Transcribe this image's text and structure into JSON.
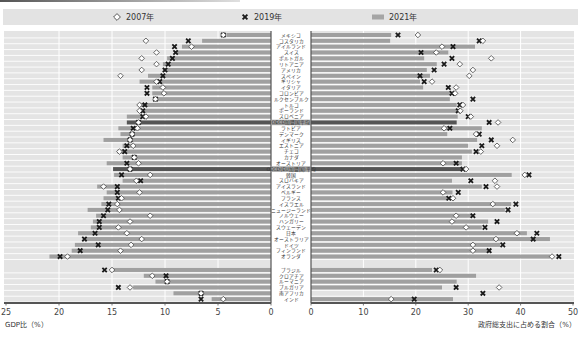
{
  "chart_data": {
    "type": "bar",
    "subtype": "back-to-back horizontal bar with point markers",
    "title": "",
    "legend_position": "top",
    "grid": true,
    "legend": [
      {
        "label": "2007年",
        "marker": "diamond"
      },
      {
        "label": "2019年",
        "marker": "cross"
      },
      {
        "label": "2021年",
        "marker": "bar"
      }
    ],
    "categories": [
      "メキシコ",
      "コスタリカ",
      "アイルランド",
      "スイス",
      "ポルトガル",
      "リトアニア",
      "アメリカ",
      "スペイン",
      "ギリシャ",
      "イタリア",
      "コロンビア",
      "ルクセンブルク",
      "トルコ",
      "ポーランド",
      "スロベニア",
      "OECD加盟国平均",
      "ラトビア",
      "デンマーク",
      "イギリス",
      "エストニア",
      "チェコ",
      "カナダ",
      "オーストリア",
      "OECD(EU加盟国)平均",
      "韓国",
      "スロバキア",
      "アイスランド",
      "ベルギー",
      "フランス",
      "イスラエル",
      "ニュージーランド",
      "ノルウェー",
      "ハンガリー",
      "スウェーデン",
      "日本",
      "オーストラリア",
      "ドイツ",
      "フィンランド",
      "オランダ",
      "ブラジル",
      "クロアチア",
      "ルーマニア",
      "ブルガリア",
      "南アフリカ",
      "インド"
    ],
    "highlighted_categories": [
      "OECD加盟国平均",
      "OECD(EU加盟国)平均"
    ],
    "panels": [
      {
        "name": "gdp-share",
        "xlabel": "GDP比（%）",
        "direction": "leftward",
        "xlim": [
          0,
          25
        ],
        "ticks": [
          25,
          20,
          15,
          10,
          5,
          0
        ],
        "series": [
          {
            "name": "2007年",
            "marker": "diamond",
            "values": [
              4.5,
              11.8,
              7.5,
              10.8,
              12.2,
              10.8,
              12.2,
              14.2,
              10.8,
              10.2,
              10.1,
              10.9,
              12.4,
              12.4,
              11.8,
              12.5,
              12.6,
              13.1,
              13.3,
              13.0,
              14.3,
              12.9,
              12.5,
              13.3,
              11.4,
              12.7,
              15.8,
              12.4,
              14.1,
              14.5,
              14.3,
              11.4,
              13.3,
              14.4,
              13.6,
              12.2,
              13.2,
              14.2,
              19.2,
              15.0,
              11.2,
              9.8,
              13.3,
              6.6,
              4.5
            ]
          },
          {
            "name": "2019年",
            "marker": "cross",
            "values": [
              4.5,
              7.8,
              9.1,
              9.0,
              9.3,
              9.7,
              10.0,
              10.2,
              10.5,
              11.7,
              11.7,
              10.9,
              11.9,
              12.1,
              12.1,
              12.5,
              13.0,
              13.1,
              13.3,
              13.6,
              13.8,
              12.9,
              13.6,
              13.3,
              14.1,
              12.3,
              14.5,
              14.5,
              14.4,
              15.3,
              15.4,
              15.8,
              16.2,
              16.2,
              16.6,
              17.6,
              16.3,
              18.0,
              19.9,
              15.7,
              9.9,
              9.8,
              14.4,
              6.6,
              6.6
            ]
          },
          {
            "name": "2021年",
            "marker": "bar",
            "values": [
              4.2,
              6.5,
              8.4,
              8.9,
              9.8,
              10.2,
              10.2,
              11.6,
              12.4,
              11.2,
              11.2,
              10.8,
              12.4,
              12.4,
              13.6,
              13.6,
              14.4,
              14.2,
              15.8,
              14.0,
              14.5,
              14.0,
              15.5,
              14.9,
              14.8,
              14.0,
              16.4,
              15.5,
              15.8,
              16.0,
              17.3,
              16.5,
              16.8,
              17.0,
              18.2,
              17.5,
              18.5,
              18.8,
              20.9,
              14.9,
              12.0,
              10.9,
              13.0,
              9.2,
              5.6
            ]
          }
        ]
      },
      {
        "name": "government-expenditure-share",
        "xlabel": "政府総支出に占める割合（%）",
        "direction": "rightward",
        "xlim": [
          0,
          50
        ],
        "ticks": [
          0,
          10,
          20,
          30,
          40,
          50
        ],
        "series": [
          {
            "name": "2007年",
            "marker": "diamond",
            "values": [
              20.4,
              32.8,
              25.0,
              23.9,
              34.4,
              28.4,
              30.9,
              30.2,
              23.1,
              27.7,
              27.5,
              null,
              29.0,
              28.5,
              30.5,
              35.7,
              25.4,
              31.5,
              38.5,
              35.5,
              32.4,
              null,
              25.2,
              29.6,
              40.8,
              35.1,
              35.5,
              25.2,
              27.1,
              34.7,
              null,
              27.7,
              26.9,
              29.6,
              39.3,
              35.3,
              30.9,
              30.9,
              46.0,
              24.6,
              null,
              null,
              35.9,
              null,
              15.3
            ]
          },
          {
            "name": "2019年",
            "marker": "cross",
            "values": [
              16.6,
              32.1,
              27.1,
              21.0,
              26.9,
              25.4,
              23.5,
              20.8,
              21.6,
              26.2,
              26.9,
              30.9,
              28.4,
              28.1,
              30.0,
              34.0,
              26.5,
              32.1,
              34.4,
              32.6,
              31.5,
              null,
              27.7,
              29.0,
              41.6,
              30.5,
              33.4,
              28.1,
              26.3,
              39.1,
              37.6,
              30.9,
              35.5,
              33.2,
              43.1,
              42.4,
              36.6,
              34.0,
              47.3,
              23.9,
              null,
              null,
              27.7,
              32.8,
              19.7
            ]
          },
          {
            "name": "2021年",
            "marker": "bar",
            "values": [
              15.3,
              15.1,
              31.3,
              26.2,
              21.6,
              24.0,
              22.1,
              22.7,
              20.8,
              21.4,
              26.5,
              26.5,
              27.8,
              27.8,
              28.0,
              27.8,
              32.6,
              26.0,
              31.7,
              30.0,
              30.7,
              28.8,
              28.8,
              28.8,
              38.3,
              26.9,
              32.6,
              27.0,
              26.0,
              38.2,
              37.0,
              30.7,
              33.8,
              32.6,
              41.2,
              45.6,
              36.1,
              34.2,
              45.6,
              23.1,
              31.5,
              27.8,
              25.0,
              null,
              27.1
            ]
          }
        ]
      }
    ]
  },
  "colors": {
    "bar": "#a0a0a0",
    "bar_highlight": "#555555",
    "panel_background": "#e4e4e4",
    "diamond_fill": "#ffffff",
    "diamond_stroke": "#444444",
    "cross": "#1a1a1a",
    "label_highlight_background": "#9c9c9c"
  }
}
